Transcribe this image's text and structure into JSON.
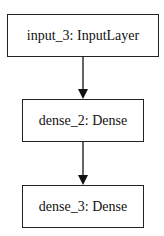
{
  "diagram": {
    "nodes": [
      {
        "id": "input_3",
        "label": "input_3: InputLayer"
      },
      {
        "id": "dense_2",
        "label": "dense_2: Dense"
      },
      {
        "id": "dense_3",
        "label": "dense_3: Dense"
      }
    ],
    "edges": [
      {
        "from": "input_3",
        "to": "dense_2"
      },
      {
        "from": "dense_2",
        "to": "dense_3"
      }
    ]
  }
}
